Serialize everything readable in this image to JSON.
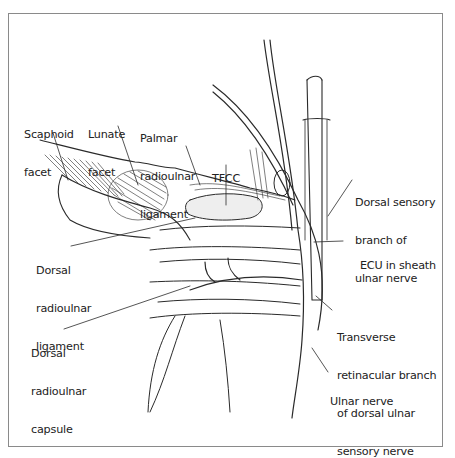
{
  "figure": {
    "labels": [
      {
        "id": "scaphoid-facet",
        "lines": [
          "Scaphoid",
          "facet"
        ]
      },
      {
        "id": "lunate-facet",
        "lines": [
          "Lunate",
          "facet"
        ]
      },
      {
        "id": "palmar-radioulnar-ligament",
        "lines": [
          "Palmar",
          "radioulnar",
          "ligament"
        ]
      },
      {
        "id": "tfcc",
        "lines": [
          "TFCC"
        ]
      },
      {
        "id": "dorsal-sensory-branch",
        "lines": [
          "Dorsal sensory",
          "branch of",
          "ulnar nerve"
        ]
      },
      {
        "id": "dorsal-radioulnar-ligament",
        "lines": [
          "Dorsal",
          "radioulnar",
          "ligament"
        ]
      },
      {
        "id": "ecu-in-sheath",
        "lines": [
          "ECU in sheath"
        ]
      },
      {
        "id": "dorsal-radioulnar-capsule",
        "lines": [
          "Dorsal",
          "radioulnar",
          "capsule"
        ]
      },
      {
        "id": "transverse-retinacular-branch",
        "lines": [
          "Transverse",
          "retinacular branch",
          "of dorsal ulnar",
          "sensory nerve"
        ]
      },
      {
        "id": "ulnar-nerve",
        "lines": [
          "Ulnar nerve"
        ]
      }
    ],
    "colors": {
      "line": "#2a2a2a",
      "frame": "#8a8a8a",
      "background": "#ffffff"
    }
  }
}
